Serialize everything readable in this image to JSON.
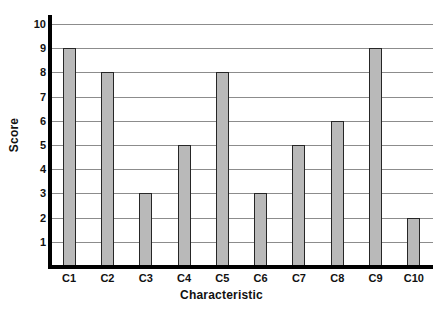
{
  "chart_data": {
    "type": "bar",
    "title": "",
    "xlabel": "Characteristic",
    "ylabel": "Score",
    "categories": [
      "C1",
      "C2",
      "C3",
      "C4",
      "C5",
      "C6",
      "C7",
      "C8",
      "C9",
      "C10"
    ],
    "values": [
      9,
      8,
      3,
      5,
      8,
      3,
      5,
      6,
      9,
      2
    ],
    "ylim": [
      0,
      10
    ],
    "yticks": [
      10,
      9,
      8,
      7,
      6,
      5,
      4,
      3,
      2,
      1
    ],
    "ytick_labels": [
      "10",
      "9",
      "8",
      "7",
      "6",
      "5",
      "4",
      "3",
      "2",
      "1"
    ],
    "grid": "horizontal",
    "legend": null,
    "bar_fill_color": "#b9b9b9",
    "bar_edge_color": "#262626",
    "gridline_color": "#8c8c8c",
    "axis_color": "#000000",
    "background_color": "#ffffff"
  }
}
